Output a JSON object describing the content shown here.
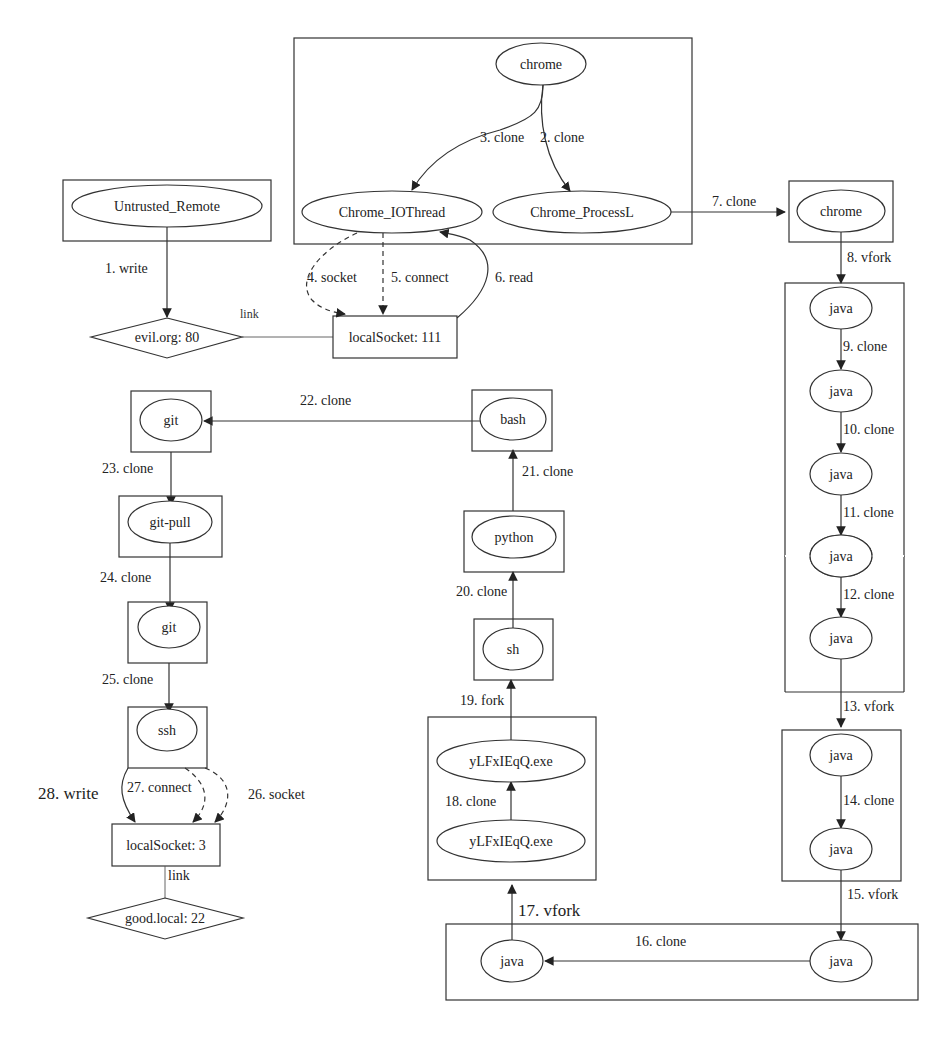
{
  "diagram": {
    "type": "provenance-graph",
    "nodes": {
      "chrome_top": "chrome",
      "chrome_iothread": "Chrome_IOThread",
      "chrome_processl": "Chrome_ProcessL",
      "untrusted_remote": "Untrusted_Remote",
      "evil_org": "evil.org: 80",
      "local_socket_111": "localSocket: 111",
      "chrome_right": "chrome",
      "java1": "java",
      "java2": "java",
      "java3": "java",
      "java4": "java",
      "java5": "java",
      "java6": "java",
      "java7": "java",
      "java_bottom_right": "java",
      "java_bottom_left": "java",
      "exe_bottom": "yLFxIEqQ.exe",
      "exe_top": "yLFxIEqQ.exe",
      "sh": "sh",
      "python": "python",
      "bash": "bash",
      "git_top": "git",
      "git_pull": "git-pull",
      "git_mid": "git",
      "ssh": "ssh",
      "local_socket_3": "localSocket: 3",
      "good_local": "good.local: 22"
    },
    "edges": {
      "e1": "1. write",
      "e2": "2. clone",
      "e3": "3. clone",
      "e4": "4. socket",
      "e5": "5. connect",
      "e6": "6. read",
      "e7": "7. clone",
      "e8": "8. vfork",
      "e9": "9. clone",
      "e10": "10. clone",
      "e11": "11. clone",
      "e12": "12. clone",
      "e13": "13. vfork",
      "e14": "14. clone",
      "e15": "15. vfork",
      "e16": "16. clone",
      "e17": "17. vfork",
      "e18": "18. clone",
      "e19": "19. fork",
      "e20": "20. clone",
      "e21": "21. clone",
      "e22": "22. clone",
      "e23": "23. clone",
      "e24": "24. clone",
      "e25": "25. clone",
      "e26": "26. socket",
      "e27": "27. connect",
      "e28": "28. write"
    },
    "links": {
      "link_top": "link",
      "link_bottom": "link"
    }
  }
}
